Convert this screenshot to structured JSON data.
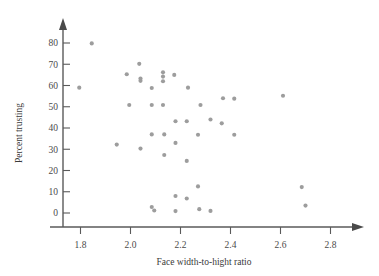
{
  "figure": {
    "background_color": "#ffffff",
    "point_color": "#9d9d9d",
    "axis_color": "#5a5a5a"
  },
  "chart_data": {
    "type": "scatter",
    "title": "",
    "xlabel": "Face width-to-hight ratio",
    "ylabel": "Percent trusting",
    "xlim": [
      1.72,
      2.86
    ],
    "ylim": [
      -4,
      86
    ],
    "xticks": [
      1.8,
      2.0,
      2.2,
      2.4,
      2.6,
      2.8
    ],
    "xtick_labels": [
      "1.8",
      "2.0",
      "2.2",
      "2.4",
      "2.6",
      "2.8"
    ],
    "yticks": [
      0,
      10,
      20,
      30,
      40,
      50,
      60,
      70,
      80
    ],
    "ytick_labels": [
      "0",
      "10",
      "20",
      "30",
      "40",
      "50",
      "60",
      "70",
      "80"
    ],
    "grid": false,
    "legend": null,
    "marker": "circle",
    "marker_size": 3,
    "n_points": 42,
    "x": [
      1.795,
      1.845,
      1.945,
      1.985,
      1.995,
      2.035,
      2.04,
      2.04,
      2.04,
      2.085,
      2.085,
      2.085,
      2.085,
      2.095,
      2.13,
      2.13,
      2.13,
      2.13,
      2.135,
      2.135,
      2.175,
      2.18,
      2.18,
      2.18,
      2.18,
      2.225,
      2.225,
      2.225,
      2.23,
      2.27,
      2.27,
      2.275,
      2.28,
      2.32,
      2.32,
      2.365,
      2.37,
      2.415,
      2.415,
      2.61,
      2.685,
      2.7
    ],
    "y": [
      59.0,
      79.8,
      32.2,
      65.3,
      50.8,
      70.2,
      63.3,
      62.2,
      30.3,
      58.8,
      50.8,
      37.0,
      2.8,
      1.2,
      66.2,
      64.2,
      62.0,
      50.8,
      37.0,
      27.3,
      65.0,
      43.2,
      33.0,
      8.0,
      0.9,
      43.2,
      24.5,
      6.8,
      59.0,
      36.8,
      12.5,
      1.8,
      50.8,
      44.0,
      1.0,
      42.2,
      54.0,
      53.8,
      36.8,
      55.2,
      12.2,
      3.5
    ]
  },
  "axis_titles": {
    "x": "Face width-to-hight ratio",
    "y": "Percent trusting"
  }
}
